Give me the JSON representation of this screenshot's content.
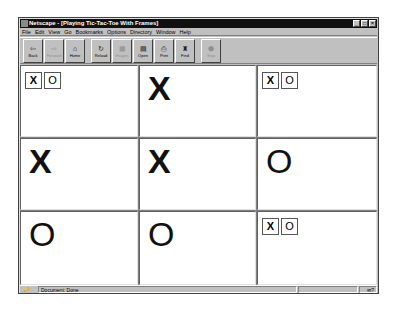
{
  "window": {
    "title": "Netscape - [Playing Tic-Tac-Toe With Frames]",
    "controls": {
      "minimize": "_",
      "maximize": "□",
      "close": "×"
    }
  },
  "menubar": {
    "items": [
      {
        "label": "File"
      },
      {
        "label": "Edit"
      },
      {
        "label": "View"
      },
      {
        "label": "Go"
      },
      {
        "label": "Bookmarks"
      },
      {
        "label": "Options"
      },
      {
        "label": "Directory"
      },
      {
        "label": "Window"
      },
      {
        "label": "Help"
      }
    ]
  },
  "toolbar": {
    "buttons": [
      {
        "label": "Back",
        "icon": "⇦",
        "enabled": true
      },
      {
        "label": "Forward",
        "icon": "⇨",
        "enabled": false
      },
      {
        "label": "Home",
        "icon": "⌂",
        "enabled": true
      },
      {
        "label": "Reload",
        "icon": "↻",
        "enabled": true
      },
      {
        "label": "Images",
        "icon": "▦",
        "enabled": false
      },
      {
        "label": "Open",
        "icon": "▤",
        "enabled": true
      },
      {
        "label": "Print",
        "icon": "⎙",
        "enabled": true
      },
      {
        "label": "Find",
        "icon": "♜",
        "enabled": true
      },
      {
        "label": "Stop",
        "icon": "⬣",
        "enabled": false
      }
    ]
  },
  "board": {
    "cells": [
      {
        "row": 0,
        "col": 0,
        "state": "choice",
        "options": [
          "X",
          "O"
        ]
      },
      {
        "row": 0,
        "col": 1,
        "state": "mark",
        "mark": "X"
      },
      {
        "row": 0,
        "col": 2,
        "state": "choice",
        "options": [
          "X",
          "O"
        ]
      },
      {
        "row": 1,
        "col": 0,
        "state": "mark",
        "mark": "X"
      },
      {
        "row": 1,
        "col": 1,
        "state": "mark",
        "mark": "X"
      },
      {
        "row": 1,
        "col": 2,
        "state": "mark",
        "mark": "O"
      },
      {
        "row": 2,
        "col": 0,
        "state": "mark",
        "mark": "O"
      },
      {
        "row": 2,
        "col": 1,
        "state": "mark",
        "mark": "O"
      },
      {
        "row": 2,
        "col": 2,
        "state": "choice",
        "options": [
          "X",
          "O"
        ]
      }
    ]
  },
  "statusbar": {
    "security_icon": "🔑",
    "text": "Document: Done",
    "mail_icon": "✉?"
  }
}
